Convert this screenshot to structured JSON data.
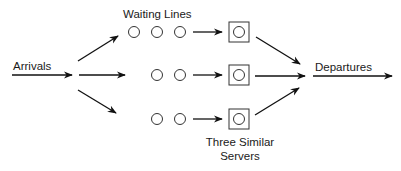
{
  "diagram": {
    "labels": {
      "arrivals": "Arrivals",
      "waiting_lines": "Waiting Lines",
      "departures": "Departures",
      "servers_line1": "Three Similar",
      "servers_line2": "Servers"
    },
    "colors": {
      "stroke": "#111111",
      "background": "#ffffff"
    },
    "queues": [
      {
        "id": "queue-1",
        "customers_waiting": 3
      },
      {
        "id": "queue-2",
        "customers_waiting": 2
      },
      {
        "id": "queue-3",
        "customers_waiting": 2
      }
    ],
    "servers": [
      {
        "id": "server-1"
      },
      {
        "id": "server-2"
      },
      {
        "id": "server-3"
      }
    ]
  }
}
